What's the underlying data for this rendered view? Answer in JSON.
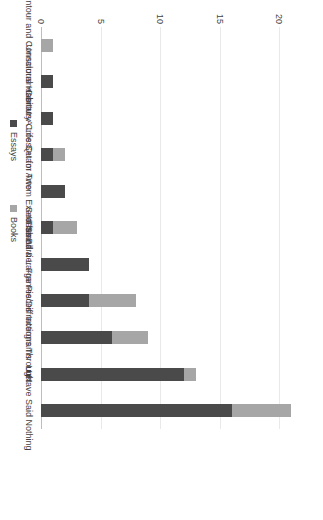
{
  "chart_data": {
    "type": "bar",
    "subtype": "stacked-horizontal",
    "title": "",
    "xlabel": "",
    "ylabel": "",
    "categories": [
      "Contour and Consciousness",
      "Unnatural Habitats",
      "Century Cross",
      "A Life Set for Two",
      "Quam Artem Exerceas",
      "Sea Island",
      "In Small & Large Pieces",
      "The Barrier Frames/Diffractions Through",
      "Intergrams",
      "Lust",
      "I Have Said Nothing"
    ],
    "series": [
      {
        "name": "Essays",
        "color": "#4a4a4a",
        "values": [
          0,
          1,
          1,
          1,
          2,
          1,
          4,
          4,
          6,
          12,
          16
        ]
      },
      {
        "name": "Books",
        "color": "#a6a6a6",
        "values": [
          1,
          0,
          0,
          1,
          0,
          2,
          0,
          4,
          3,
          1,
          5
        ]
      }
    ],
    "totals": [
      1,
      1,
      1,
      2,
      2,
      3,
      4,
      8,
      9,
      13,
      21
    ],
    "ticks": [
      0,
      5,
      10,
      15,
      20
    ],
    "tick_labels": [
      "0",
      "5",
      "10",
      "15",
      "20"
    ],
    "ylim": [
      0,
      22
    ],
    "grid": true,
    "legend_position": "bottom"
  },
  "legend": {
    "items": [
      {
        "label": "Essays",
        "color": "#4a4a4a"
      },
      {
        "label": "Books",
        "color": "#a6a6a6"
      }
    ]
  },
  "colors": {
    "essays": "#4a4a4a",
    "books": "#a6a6a6",
    "gridline": "#e9e9e9",
    "axis": "#bdbdbd",
    "text": "#3f3f3f",
    "background": "#ffffff"
  }
}
